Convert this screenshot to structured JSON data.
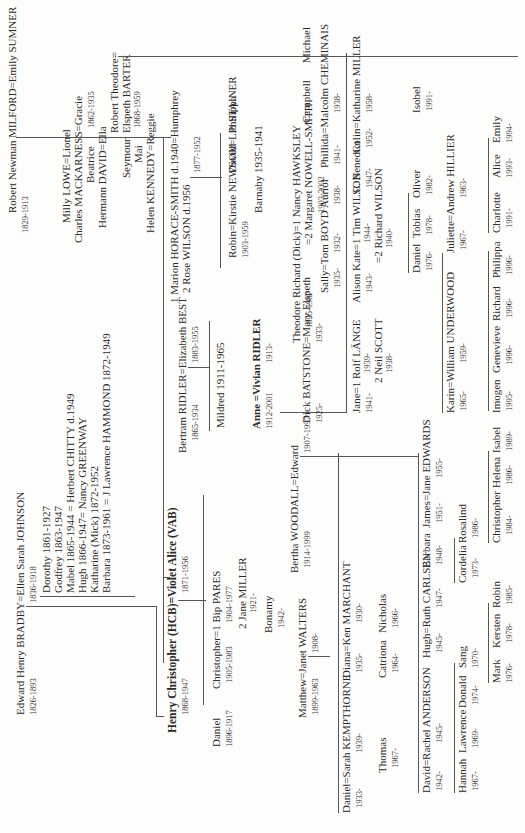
{
  "generation1": {
    "bradby": {
      "couple": "Edward Henry BRADBY=Ellen Sarah JOHNSON",
      "dates_husband": "1826-1893",
      "dates_wife": "1836-1918"
    },
    "bradby_children": [
      "Dorothy 1861-1927",
      "Godfrey 1863-1947",
      "Mabel 1865-1944 = Herbert CHITTY d.1949",
      "Hugh 1866-1947= Nancy GREENWAY",
      "Katharine (Mick) 1872-1952",
      "Barbara 1873-1961 = J Lawrence HAMMOND 1872-1949"
    ],
    "milford": {
      "couple": "Robert Newman MILFORD=Emily SUMNER",
      "dates": "1829-1913"
    },
    "milford_children": [
      "Milly LOWE=Lionel",
      "Charles MACKARNESS=Gracie",
      "Beatrice",
      "Hermann DAVID=Ella",
      "Seymour",
      "Mai",
      "Helen KENNEDY=Reggie"
    ],
    "robert_theodore": {
      "name1": "Robert Theodore=",
      "name2": "Elspeth BARTER",
      "dates1": "1862-1935",
      "dates2": "1868-1959"
    }
  },
  "generation2": {
    "hcb": {
      "couple": "Henry Christopher (HCB)=Violet Alice (VAB)",
      "dates_husband": "1868-1947",
      "dates_wife": "1871-1956"
    },
    "bertram": {
      "couple": "Bertram RIDLER=Elizabeth BEST",
      "dates_husband": "1865-1934",
      "dates_wife": "1883-1955"
    },
    "mildred": "Mildred 1911-1965",
    "humphrey": {
      "line1": "1 Marion HORACE-SMITH d.1940=Humphrey",
      "line2": "2 Rose WILSON d.1956",
      "dates": "1877-1952"
    }
  },
  "generation3": {
    "daniel_1896": {
      "name": "Daniel",
      "dates": "1896-1917"
    },
    "christopher": {
      "name": "Christopher=1 Bip PARES",
      "dates": "1905-1983",
      "bip_dates": "1904-1977",
      "second": "2 Jane MILLER",
      "second_dates": "1921-"
    },
    "bonamy": {
      "name": "Bonamy",
      "dates": "1942-"
    },
    "matthew": {
      "name": "Matthew=Janet WALTERS",
      "dates": "1899-1963",
      "janet_dates": "1908-"
    },
    "bertha": {
      "name": "Bertha WOODALL=Edward",
      "dates": "1914-1999",
      "edward_dates": "1907-1997"
    },
    "anne": {
      "name": "Anne =Vivian RIDLER",
      "dates": "1912-2001",
      "vivian_dates": "1913-"
    },
    "robin": {
      "name": "Robin=Kirstie NEWSOM",
      "dates": "1903-1959"
    },
    "barnaby": "Barnaby 1935-1941",
    "david_lib": "David=Lib STAINER",
    "philippa": "Philippa",
    "theodore": {
      "name": "Theodore Richard (Dick)=1 Nancy HAWKSLEY",
      "dates": "1895-1987",
      "second": "=2 Margaret NOWELL-SMITH",
      "second_dates": "1903-2002"
    },
    "campbell": "Campbell",
    "michael": "Michael"
  },
  "generation4": {
    "daniel_sarah": {
      "name": "Daniel=Sarah KEMPTHORNE",
      "dates": "1933-",
      "sarah_dates": "1939-"
    },
    "thomas": {
      "name": "Thomas",
      "dates": "1967-"
    },
    "diana": {
      "name": "Diana=Ken MARCHANT",
      "dates": "1935-",
      "ken_dates": "1930-"
    },
    "catriona": {
      "name": "Catriona",
      "dates": "1964-"
    },
    "nicholas": {
      "name": "Nicholas",
      "dates": "1966-"
    },
    "dick_batstone": {
      "name": "Dick BATSTONE=Mary Elspeth",
      "dates": "1925-",
      "mary_dates": "1933-"
    },
    "sally": {
      "name": "Sally=Tom BOYD",
      "dates": "1935-",
      "tom_dates": "1932-"
    },
    "auriol": {
      "name": "Auriol",
      "dates": "1938-"
    },
    "phillida": {
      "name": "Phillida=Malcolm CHEMINAIS",
      "dates": "1941-",
      "malcolm_dates": "1938-"
    },
    "jane_rolf": {
      "name": "Jane=1 Rolf LÄNGE",
      "dates": "1941-",
      "rolf_dates": "1939-",
      "second": "2 Neil SCOTT",
      "second_dates": "1938-"
    },
    "alison": {
      "name": "Alison Kate=1 Tim WILSON",
      "dates": "1943-",
      "tim_dates": "1944-",
      "second": "=2 Richard WILSON",
      "second_dates": "1940-"
    },
    "benedict": {
      "name": "C. Benedict",
      "dates": "1947-"
    },
    "colin": {
      "name": "Colin=Katharine MILLER",
      "dates": "1952-",
      "katharine_dates": "1958-"
    },
    "isobel": {
      "name": "Isobel",
      "dates": "1991-"
    }
  },
  "generation5": {
    "david_rachel": {
      "name": "David=Rachel ANDERSON",
      "dates": "1942-",
      "rachel_dates": "1945-"
    },
    "hannah": {
      "name": "Hannah",
      "dates": "1967-"
    },
    "lawrence": {
      "name": "Lawrence",
      "dates": "1969-"
    },
    "donald": {
      "name": "Donald",
      "dates": "1974-"
    },
    "sang": {
      "name": "Sang",
      "dates": "1970-"
    },
    "hugh_ruth": {
      "name": "Hugh=Ruth CARLSEN",
      "dates": "1945-",
      "ruth_dates": "1947-"
    },
    "mark": {
      "name": "Mark",
      "dates": "1976-"
    },
    "kersten": {
      "name": "Kersten",
      "dates": "1978-"
    },
    "robin_b": {
      "name": "Robin",
      "dates": "1985-"
    },
    "barbara": {
      "name": "Barbara",
      "dates": "1948-"
    },
    "cordelia": {
      "name": "Cordelia",
      "dates": "1973-"
    },
    "rosalind": {
      "name": "Rosalind",
      "dates": "1986-"
    },
    "james": {
      "name": "James=Jane EDWARDS",
      "dates": "1951-",
      "jane_dates": "1955-"
    },
    "christopher_b": {
      "name": "Christopher",
      "dates": "1984-"
    },
    "helena": {
      "name": "Helena",
      "dates": "1986-"
    },
    "isabel": {
      "name": "Isabel",
      "dates": "1989-"
    },
    "karin": {
      "name": "Karin=William UNDERWOOD",
      "dates": "1965-",
      "william_dates": "1959-"
    },
    "imogen": {
      "name": "Imogen",
      "dates": "1995-"
    },
    "genevieve": {
      "name": "Genevieve",
      "dates": "1996-"
    },
    "richard": {
      "name": "Richard",
      "dates": "1996-"
    },
    "philippa_u": {
      "name": "Philippa",
      "dates": "1996-"
    },
    "daniel_w": {
      "name": "Daniel",
      "dates": "1976-"
    },
    "tobias": {
      "name": "Tobias",
      "dates": "1978-"
    },
    "oliver": {
      "name": "Oliver",
      "dates": "1982-"
    },
    "juliette": {
      "name": "Juliette=Andrew HILLIER",
      "dates": "1967-",
      "andrew_dates": "1963-"
    },
    "charlotte": {
      "name": "Charlotte",
      "dates": "1991-"
    },
    "alice": {
      "name": "Alice",
      "dates": "1993-"
    },
    "emily": {
      "name": "Emily",
      "dates": "1994-"
    }
  }
}
